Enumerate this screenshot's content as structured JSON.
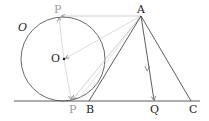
{
  "diagram": {
    "circle_label": "O",
    "labels": {
      "P_top": "P",
      "O": "O",
      "P_bottom": "P",
      "A": "A",
      "B": "B",
      "Q": "Q",
      "C": "C"
    },
    "colors": {
      "line": "#333333",
      "light": "#bbbbbb",
      "label_gray": "#999999"
    }
  }
}
